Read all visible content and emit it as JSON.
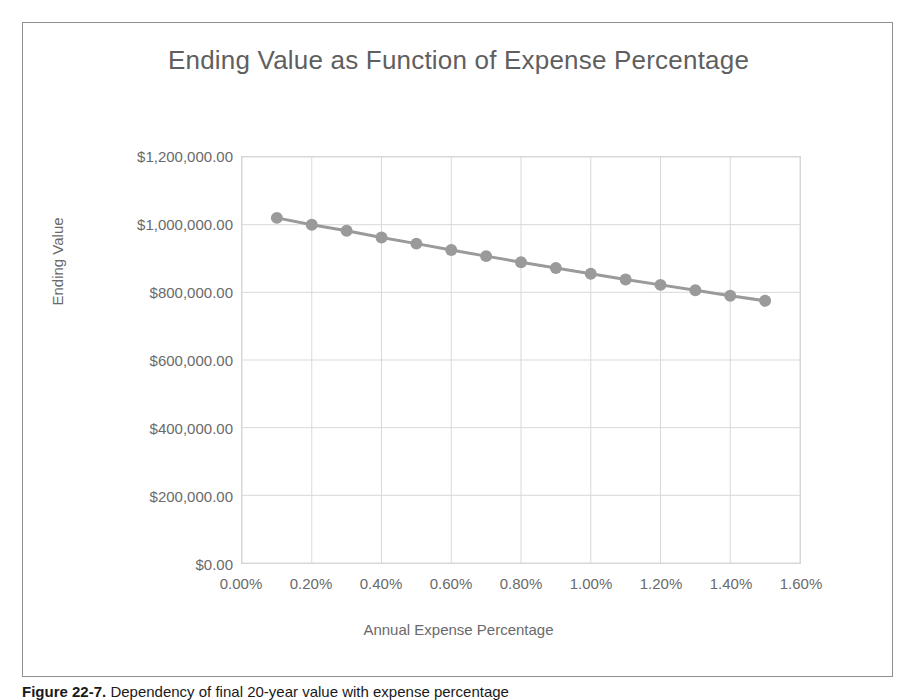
{
  "figure": {
    "caption_label": "Figure 22-7.",
    "caption_text": "Dependency of final 20-year value with expense percentage"
  },
  "chart_data": {
    "type": "line",
    "title": "Ending Value as Function of Expense Percentage",
    "xlabel": "Annual Expense Percentage",
    "ylabel": "Ending Value",
    "grid": true,
    "legend": "none",
    "marker": "circle",
    "series_color": "#9a9a9a",
    "xlim": [
      0.0,
      1.6
    ],
    "ylim": [
      0,
      1200000
    ],
    "x_tick_labels": [
      "0.00%",
      "0.20%",
      "0.40%",
      "0.60%",
      "0.80%",
      "1.00%",
      "1.20%",
      "1.40%",
      "1.60%"
    ],
    "x_tick_values": [
      0.0,
      0.2,
      0.4,
      0.6,
      0.8,
      1.0,
      1.2,
      1.4,
      1.6
    ],
    "y_tick_labels": [
      "$1,200,000.00",
      "$1,000,000.00",
      "$800,000.00",
      "$600,000.00",
      "$400,000.00",
      "$200,000.00",
      "$0.00"
    ],
    "y_tick_values": [
      1200000,
      1000000,
      800000,
      600000,
      400000,
      200000,
      0
    ],
    "x": [
      0.1,
      0.2,
      0.3,
      0.4,
      0.5,
      0.6,
      0.7,
      0.8,
      0.9,
      1.0,
      1.1,
      1.2,
      1.3,
      1.4,
      1.5
    ],
    "values": [
      1020000,
      1000000,
      982000,
      962000,
      944000,
      925000,
      907000,
      889000,
      872000,
      855000,
      838000,
      822000,
      806000,
      790000,
      775000
    ]
  }
}
